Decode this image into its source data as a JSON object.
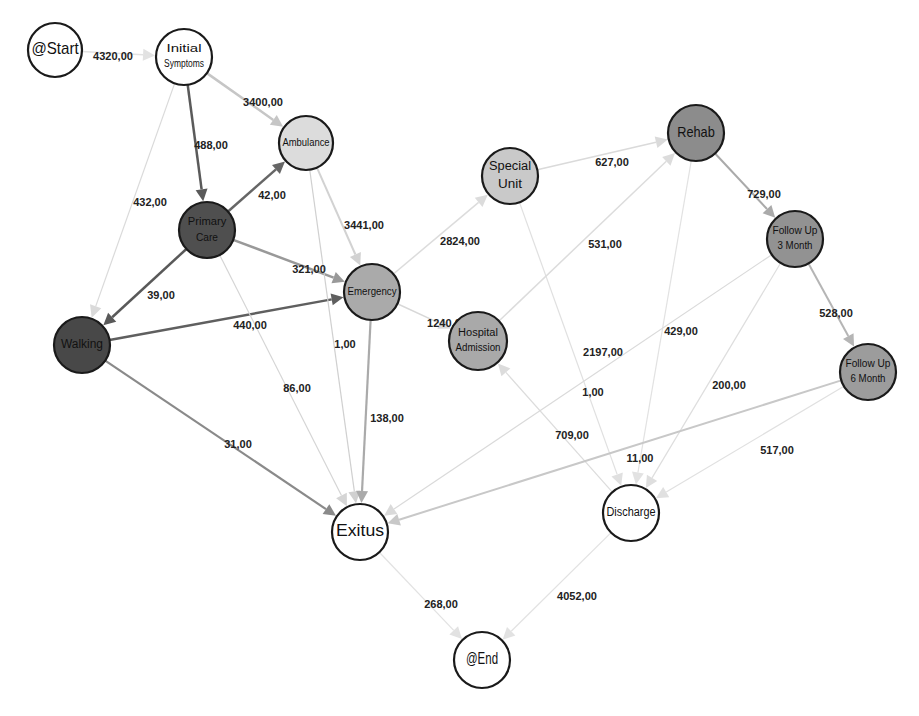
{
  "diagram": {
    "type": "process-flow-graph",
    "number_format": "comma-decimal",
    "nodes": [
      {
        "id": "start",
        "label": [
          "@Start"
        ],
        "x": 55,
        "y": 50,
        "r": 27,
        "fill": "#ffffff",
        "font": 17
      },
      {
        "id": "initial_symptoms",
        "label": [
          "Initial",
          "Symptoms"
        ],
        "x": 184,
        "y": 57,
        "r": 28,
        "fill": "#ffffff",
        "font": 10
      },
      {
        "id": "ambulance",
        "label": [
          "Ambulance"
        ],
        "x": 306,
        "y": 143,
        "r": 27,
        "fill": "#dcdcdc",
        "font": 11
      },
      {
        "id": "primary_care",
        "label": [
          "Primary",
          "Care"
        ],
        "x": 207,
        "y": 230,
        "r": 28,
        "fill": "#4f4f4f",
        "font": 11
      },
      {
        "id": "walking",
        "label": [
          "Walking"
        ],
        "x": 82,
        "y": 345,
        "r": 28,
        "fill": "#484848",
        "font": 12
      },
      {
        "id": "emergency",
        "label": [
          "Emergency"
        ],
        "x": 372,
        "y": 292,
        "r": 28,
        "fill": "#aaaaaa",
        "font": 11
      },
      {
        "id": "special_unit",
        "label": [
          "Special",
          "Unit"
        ],
        "x": 510,
        "y": 176,
        "r": 28,
        "fill": "#c9c9c9",
        "font": 12
      },
      {
        "id": "hospital_admission",
        "label": [
          "Hospital",
          "Admission"
        ],
        "x": 478,
        "y": 341,
        "r": 29,
        "fill": "#a9a9a9",
        "font": 10
      },
      {
        "id": "rehab",
        "label": [
          "Rehab"
        ],
        "x": 696,
        "y": 133,
        "r": 28,
        "fill": "#8c8c8c",
        "font": 15
      },
      {
        "id": "follow_up_3",
        "label": [
          "Follow Up",
          "3 Month"
        ],
        "x": 795,
        "y": 239,
        "r": 28,
        "fill": "#929292",
        "font": 10
      },
      {
        "id": "follow_up_6",
        "label": [
          "Follow Up",
          "6 Month"
        ],
        "x": 868,
        "y": 372,
        "r": 28,
        "fill": "#9c9c9c",
        "font": 10
      },
      {
        "id": "exitus",
        "label": [
          "Exitus"
        ],
        "x": 360,
        "y": 532,
        "r": 28,
        "fill": "#ffffff",
        "font": 16
      },
      {
        "id": "discharge",
        "label": [
          "Discharge"
        ],
        "x": 631,
        "y": 513,
        "r": 28,
        "fill": "#ffffff",
        "font": 12
      },
      {
        "id": "end",
        "label": [
          "@End"
        ],
        "x": 482,
        "y": 660,
        "r": 28,
        "fill": "#ffffff",
        "font": 16
      }
    ],
    "edges": [
      {
        "from": "start",
        "to": "initial_symptoms",
        "value": "4320,00",
        "color": "#e2e2e2",
        "width": 1.5,
        "lx": 113,
        "ly": 57
      },
      {
        "from": "initial_symptoms",
        "to": "ambulance",
        "value": "3400,00",
        "color": "#c6c6c6",
        "width": 2.5,
        "lx": 263,
        "ly": 103
      },
      {
        "from": "initial_symptoms",
        "to": "primary_care",
        "value": "488,00",
        "color": "#5a5a5a",
        "width": 2.5,
        "lx": 211,
        "ly": 146
      },
      {
        "from": "initial_symptoms",
        "to": "walking",
        "value": "432,00",
        "color": "#dadada",
        "width": 1.2,
        "lx": 150,
        "ly": 203
      },
      {
        "from": "primary_care",
        "to": "ambulance",
        "value": "42,00",
        "color": "#666666",
        "width": 2.5,
        "lx": 272,
        "ly": 196
      },
      {
        "from": "primary_care",
        "to": "emergency",
        "value": "321,00",
        "color": "#999999",
        "width": 2.5,
        "lx": 309,
        "ly": 270
      },
      {
        "from": "primary_care",
        "to": "walking",
        "value": "39,00",
        "color": "#595959",
        "width": 2.5,
        "lx": 161,
        "ly": 296
      },
      {
        "from": "walking",
        "to": "emergency",
        "value": "440,00",
        "color": "#5f5f5f",
        "width": 2.5,
        "lx": 250,
        "ly": 326
      },
      {
        "from": "primary_care",
        "to": "exitus",
        "value": "86,00",
        "color": "#d5d5d5",
        "width": 1.2,
        "lx": 297,
        "ly": 389
      },
      {
        "from": "walking",
        "to": "exitus",
        "value": "31,00",
        "color": "#8a8a8a",
        "width": 2.2,
        "lx": 238,
        "ly": 445
      },
      {
        "from": "ambulance",
        "to": "emergency",
        "value": "3441,00",
        "color": "#d2d2d2",
        "width": 2,
        "lx": 364,
        "ly": 226
      },
      {
        "from": "ambulance",
        "to": "exitus",
        "value": "1,00",
        "color": "#d0d0d0",
        "width": 1.2,
        "lx": 345,
        "ly": 345
      },
      {
        "from": "emergency",
        "to": "exitus",
        "value": "138,00",
        "color": "#aaaaaa",
        "width": 2.2,
        "lx": 387,
        "ly": 419
      },
      {
        "from": "emergency",
        "to": "special_unit",
        "value": "2824,00",
        "color": "#dcdcdc",
        "width": 1.5,
        "lx": 460,
        "ly": 242
      },
      {
        "from": "emergency",
        "to": "hospital_admission",
        "value": "1240,00",
        "color": "#d8d8d8",
        "width": 1.5,
        "lx": 447,
        "ly": 324
      },
      {
        "from": "special_unit",
        "to": "rehab",
        "value": "627,00",
        "color": "#dadada",
        "width": 1.5,
        "lx": 612,
        "ly": 163
      },
      {
        "from": "special_unit",
        "to": "discharge",
        "value": "2197,00",
        "color": "#e0e0e0",
        "width": 1.2,
        "lx": 603,
        "ly": 353
      },
      {
        "from": "hospital_admission",
        "to": "rehab",
        "value": "531,00",
        "color": "#dcdcdc",
        "width": 1.5,
        "lx": 605,
        "ly": 245
      },
      {
        "from": "discharge",
        "to": "hospital_admission",
        "value": "709,00",
        "color": "#dcdcdc",
        "width": 1.2,
        "lx": 572,
        "ly": 436
      },
      {
        "from": "rehab",
        "to": "follow_up_3",
        "value": "729,00",
        "color": "#aaaaaa",
        "width": 2,
        "lx": 764,
        "ly": 195
      },
      {
        "from": "rehab",
        "to": "discharge",
        "value": "11,00",
        "color": "#e2e2e2",
        "width": 1.2,
        "lx": 640,
        "ly": 459
      },
      {
        "from": "follow_up_3",
        "to": "follow_up_6",
        "value": "528,00",
        "color": "#b5b5b5",
        "width": 2,
        "lx": 836,
        "ly": 314
      },
      {
        "from": "follow_up_3",
        "to": "exitus",
        "value": "429,00",
        "color": "#dadada",
        "width": 1.2,
        "lx": 681,
        "ly": 332
      },
      {
        "from": "follow_up_3",
        "to": "discharge",
        "value": "200,00",
        "color": "#dedede",
        "width": 1.2,
        "lx": 729,
        "ly": 386
      },
      {
        "from": "follow_up_6",
        "to": "exitus",
        "value": "1,00",
        "color": "#c8c8c8",
        "width": 2,
        "lx": 593,
        "ly": 393
      },
      {
        "from": "follow_up_6",
        "to": "discharge",
        "value": "517,00",
        "color": "#e0e0e0",
        "width": 1.2,
        "lx": 777,
        "ly": 451
      },
      {
        "from": "exitus",
        "to": "end",
        "value": "268,00",
        "color": "#e2e2e2",
        "width": 1.2,
        "lx": 441,
        "ly": 605
      },
      {
        "from": "discharge",
        "to": "end",
        "value": "4052,00",
        "color": "#e2e2e2",
        "width": 1.2,
        "lx": 577,
        "ly": 597
      }
    ]
  }
}
